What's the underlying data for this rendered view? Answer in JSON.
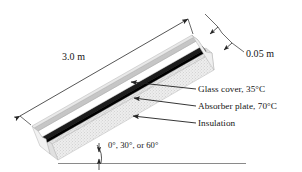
{
  "figure": {
    "labels": {
      "length": "3.0 m",
      "thickness": "0.05 m",
      "glass_cover": "Glass cover, 35°C",
      "absorber_plate": "Absorber plate, 70°C",
      "insulation": "Insulation",
      "tilt_angle": "0°, 30°, or 60°"
    },
    "colors": {
      "outline": "#3d3d3d",
      "glass_cover": "#c9c9c9",
      "absorber_plate": "#1c1c1c",
      "insulation": "#d8d8d8",
      "ground_line": "#8a8a8a",
      "leader_line": "#2b2b2b",
      "background": "#ffffff"
    },
    "parts": [
      {
        "name": "glass-cover",
        "temperature_c": 35,
        "shade": "light-gray-band"
      },
      {
        "name": "absorber-plate",
        "temperature_c": 70,
        "shade": "black-band"
      },
      {
        "name": "insulation",
        "shade": "stippled-gray"
      }
    ],
    "dimensions": {
      "collector_length_m": 3.0,
      "air_gap_thickness_m": 0.05,
      "tilt_angles_deg": [
        0,
        30,
        60
      ]
    },
    "icons": {
      "arrow": "arrowhead",
      "angle_arc": "angle-arc"
    }
  }
}
